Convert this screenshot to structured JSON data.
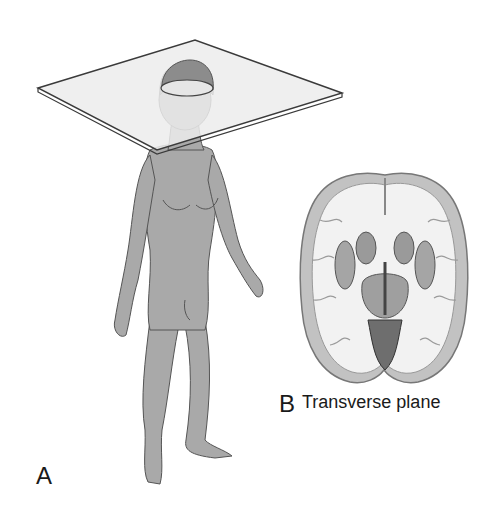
{
  "figure": {
    "panel_a": {
      "letter": "A",
      "description": "Standing human figure with a transverse plane passing through the head"
    },
    "panel_b": {
      "letter": "B",
      "caption": "Transverse plane",
      "description": "Transverse (horizontal) section of the brain"
    },
    "colors": {
      "background": "#ffffff",
      "body_fill": "#a9a9a9",
      "plane_fill": "#ececec",
      "plane_edge": "#3a3a3a",
      "brain_white_matter": "#f2f2f2",
      "brain_gray_matter": "#bdbdbd",
      "brain_deep_nuclei": "#9a9a9a",
      "text": "#1a1a1a"
    }
  }
}
